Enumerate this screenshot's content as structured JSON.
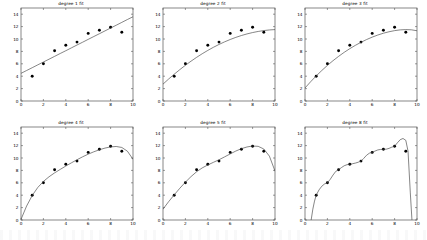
{
  "figure": {
    "background_color": "#ffffff",
    "line_color": "#444444",
    "marker_color": "#000000",
    "axis_color": "#555555",
    "rows": 2,
    "cols": 3
  },
  "chart_data": [
    {
      "type": "scatter",
      "title": "degree 1 fit",
      "xlabel": "",
      "ylabel": "",
      "xlim": [
        0,
        10
      ],
      "ylim": [
        0,
        15
      ],
      "xticks": [
        0,
        2,
        4,
        6,
        8,
        10
      ],
      "yticks": [
        0,
        2,
        4,
        6,
        8,
        10,
        12,
        14
      ],
      "grid": false,
      "legend": "none",
      "series": [
        {
          "name": "data",
          "kind": "scatter",
          "x": [
            1,
            2,
            3,
            4,
            5,
            6,
            7,
            8,
            9
          ],
          "y": [
            4.0,
            6.0,
            8.1,
            9.0,
            9.5,
            10.9,
            11.4,
            11.9,
            11.1
          ]
        },
        {
          "name": "degree 1 polynomial fit",
          "kind": "line",
          "degree": 1,
          "x": [
            0.0,
            0.5,
            1.0,
            1.5,
            2.0,
            2.5,
            3.0,
            3.5,
            4.0,
            4.5,
            5.0,
            5.5,
            6.0,
            6.5,
            7.0,
            7.5,
            8.0,
            8.5,
            9.0,
            9.5,
            10.0
          ],
          "y": [
            4.46,
            4.92,
            5.37,
            5.83,
            6.29,
            6.74,
            7.2,
            7.66,
            8.11,
            8.57,
            9.03,
            9.48,
            9.94,
            10.4,
            10.85,
            11.31,
            11.77,
            12.22,
            12.68,
            13.14,
            13.59
          ]
        }
      ]
    },
    {
      "type": "scatter",
      "title": "degree 2 fit",
      "xlabel": "",
      "ylabel": "",
      "xlim": [
        0,
        10
      ],
      "ylim": [
        0,
        15
      ],
      "xticks": [
        0,
        2,
        4,
        6,
        8,
        10
      ],
      "yticks": [
        0,
        2,
        4,
        6,
        8,
        10,
        12,
        14
      ],
      "grid": false,
      "legend": "none",
      "series": [
        {
          "name": "data",
          "kind": "scatter",
          "x": [
            1,
            2,
            3,
            4,
            5,
            6,
            7,
            8,
            9
          ],
          "y": [
            4.0,
            6.0,
            8.1,
            9.0,
            9.5,
            10.9,
            11.4,
            11.9,
            11.1
          ]
        },
        {
          "name": "degree 2 polynomial fit",
          "kind": "line",
          "degree": 2,
          "x": [
            0.0,
            0.5,
            1.0,
            1.5,
            2.0,
            2.5,
            3.0,
            3.5,
            4.0,
            4.5,
            5.0,
            5.5,
            6.0,
            6.5,
            7.0,
            7.5,
            8.0,
            8.5,
            9.0,
            9.5,
            10.0
          ],
          "y": [
            2.72,
            3.54,
            4.32,
            5.06,
            5.76,
            6.42,
            7.04,
            7.62,
            8.16,
            8.66,
            9.12,
            9.54,
            9.92,
            10.26,
            10.56,
            10.82,
            11.04,
            11.22,
            11.36,
            11.46,
            11.52
          ]
        }
      ]
    },
    {
      "type": "scatter",
      "title": "degree 3 fit",
      "xlabel": "",
      "ylabel": "",
      "xlim": [
        0,
        10
      ],
      "ylim": [
        0,
        15
      ],
      "xticks": [
        0,
        2,
        4,
        6,
        8,
        10
      ],
      "yticks": [
        0,
        2,
        4,
        6,
        8,
        10,
        12,
        14
      ],
      "grid": false,
      "legend": "none",
      "series": [
        {
          "name": "data",
          "kind": "scatter",
          "x": [
            1,
            2,
            3,
            4,
            5,
            6,
            7,
            8,
            9
          ],
          "y": [
            4.0,
            6.0,
            8.1,
            9.0,
            9.5,
            10.9,
            11.4,
            11.9,
            11.1
          ]
        },
        {
          "name": "degree 3 polynomial fit",
          "kind": "line",
          "degree": 3,
          "x": [
            0.0,
            0.5,
            1.0,
            1.5,
            2.0,
            2.5,
            3.0,
            3.5,
            4.0,
            4.5,
            5.0,
            5.5,
            6.0,
            6.5,
            7.0,
            7.5,
            8.0,
            8.5,
            9.0,
            9.5,
            10.0
          ],
          "y": [
            2.1,
            3.1,
            4.04,
            4.92,
            5.74,
            6.5,
            7.2,
            7.85,
            8.44,
            8.98,
            9.47,
            9.91,
            10.3,
            10.64,
            10.93,
            11.17,
            11.35,
            11.47,
            11.52,
            11.48,
            11.33
          ]
        }
      ]
    },
    {
      "type": "scatter",
      "title": "degree 4 fit",
      "xlabel": "",
      "ylabel": "",
      "xlim": [
        0,
        10
      ],
      "ylim": [
        0,
        15
      ],
      "xticks": [
        0,
        2,
        4,
        6,
        8,
        10
      ],
      "yticks": [
        0,
        2,
        4,
        6,
        8,
        10,
        12,
        14
      ],
      "grid": false,
      "legend": "none",
      "series": [
        {
          "name": "data",
          "kind": "scatter",
          "x": [
            1,
            2,
            3,
            4,
            5,
            6,
            7,
            8,
            9
          ],
          "y": [
            4.0,
            6.0,
            8.1,
            9.0,
            9.5,
            10.9,
            11.4,
            11.9,
            11.1
          ]
        },
        {
          "name": "degree 4 polynomial fit",
          "kind": "line",
          "degree": 4,
          "x": [
            0.0,
            0.5,
            1.0,
            1.5,
            2.0,
            2.5,
            3.0,
            3.5,
            4.0,
            4.5,
            5.0,
            5.5,
            6.0,
            6.5,
            7.0,
            7.5,
            8.0,
            8.5,
            9.0,
            9.5,
            10.0
          ],
          "y": [
            0.1,
            2.25,
            3.95,
            5.25,
            6.22,
            6.97,
            7.6,
            8.16,
            8.7,
            9.22,
            9.72,
            10.19,
            10.62,
            11.0,
            11.33,
            11.6,
            11.79,
            11.86,
            11.7,
            11.1,
            9.8
          ]
        }
      ]
    },
    {
      "type": "scatter",
      "title": "degree 5 fit",
      "xlabel": "",
      "ylabel": "",
      "xlim": [
        0,
        10
      ],
      "ylim": [
        0,
        15
      ],
      "xticks": [
        0,
        2,
        4,
        6,
        8,
        10
      ],
      "yticks": [
        0,
        2,
        4,
        6,
        8,
        10,
        12,
        14
      ],
      "grid": false,
      "legend": "none",
      "series": [
        {
          "name": "data",
          "kind": "scatter",
          "x": [
            1,
            2,
            3,
            4,
            5,
            6,
            7,
            8,
            9
          ],
          "y": [
            4.0,
            6.0,
            8.1,
            9.0,
            9.5,
            10.9,
            11.4,
            11.9,
            11.1
          ]
        },
        {
          "name": "degree 5 polynomial fit",
          "kind": "line",
          "degree": 5,
          "x": [
            0.0,
            0.5,
            1.0,
            1.5,
            2.0,
            2.5,
            3.0,
            3.5,
            4.0,
            4.5,
            5.0,
            5.5,
            6.0,
            6.5,
            7.0,
            7.5,
            8.0,
            8.5,
            9.0,
            9.5,
            10.0
          ],
          "y": [
            1.75,
            2.95,
            4.05,
            5.12,
            6.1,
            7.0,
            7.78,
            8.4,
            8.88,
            9.3,
            9.72,
            10.18,
            10.66,
            11.12,
            11.5,
            11.78,
            11.93,
            11.88,
            11.45,
            10.3,
            7.9
          ]
        }
      ]
    },
    {
      "type": "scatter",
      "title": "degree 8 fit",
      "xlabel": "",
      "ylabel": "",
      "xlim": [
        0,
        10
      ],
      "ylim": [
        0,
        15
      ],
      "xticks": [
        0,
        2,
        4,
        6,
        8,
        10
      ],
      "yticks": [
        0,
        2,
        4,
        6,
        8,
        10,
        12,
        14
      ],
      "grid": false,
      "legend": "none",
      "series": [
        {
          "name": "data",
          "kind": "scatter",
          "x": [
            1,
            2,
            3,
            4,
            5,
            6,
            7,
            8,
            9
          ],
          "y": [
            4.0,
            6.0,
            8.1,
            9.0,
            9.5,
            10.9,
            11.4,
            11.9,
            11.1
          ]
        },
        {
          "name": "degree 8 polynomial fit",
          "kind": "line",
          "degree": 8,
          "x": [
            0.55,
            0.7,
            0.85,
            1.0,
            1.25,
            1.5,
            1.75,
            2.0,
            2.25,
            2.5,
            2.75,
            3.0,
            3.25,
            3.5,
            3.75,
            4.0,
            4.25,
            4.5,
            4.75,
            5.0,
            5.25,
            5.5,
            5.75,
            6.0,
            6.25,
            6.5,
            6.75,
            7.0,
            7.25,
            7.5,
            7.75,
            8.0,
            8.25,
            8.5,
            8.75,
            9.0,
            9.2,
            9.4,
            9.55
          ],
          "y": [
            0.0,
            1.75,
            3.05,
            4.0,
            4.85,
            5.45,
            5.82,
            6.0,
            6.55,
            7.25,
            7.85,
            8.1,
            8.45,
            8.75,
            8.92,
            9.0,
            9.08,
            9.18,
            9.32,
            9.5,
            9.95,
            10.45,
            10.78,
            10.9,
            11.12,
            11.3,
            11.38,
            11.4,
            11.42,
            11.55,
            11.75,
            11.9,
            12.45,
            12.95,
            13.15,
            12.85,
            11.1,
            4.5,
            0.0
          ]
        }
      ]
    }
  ]
}
